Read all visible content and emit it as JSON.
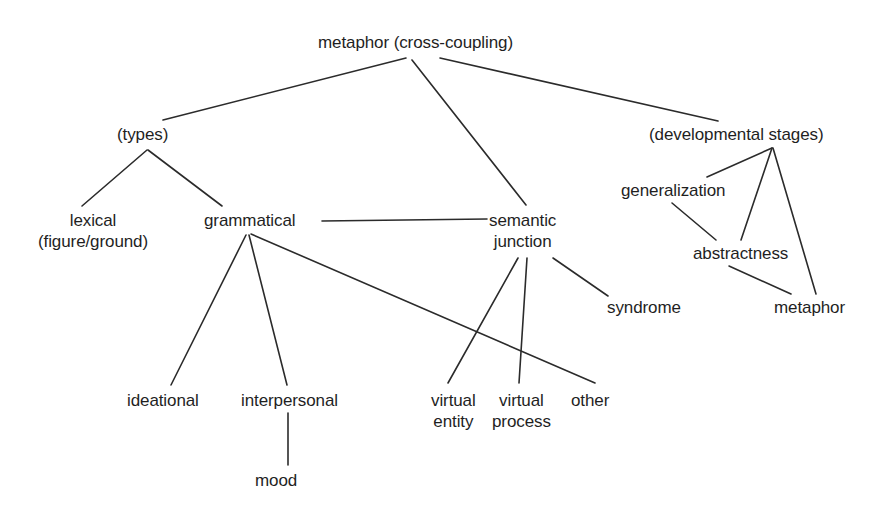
{
  "diagram": {
    "title": "metaphor (cross-coupling)",
    "type": "tree-diagram",
    "background_color": "#ffffff",
    "line_color": "#2b2b2b",
    "text_color": "#1f1f1f",
    "nodes": [
      {
        "id": "metaphor_root",
        "label": "metaphor (cross-coupling)",
        "label2": "",
        "x": 318,
        "y": 32,
        "w": 215
      },
      {
        "id": "types",
        "label": "(types)",
        "label2": "",
        "x": 117,
        "y": 124,
        "w": 64
      },
      {
        "id": "developmental_stages",
        "label": "(developmental stages)",
        "label2": "",
        "x": 649,
        "y": 124,
        "w": 180
      },
      {
        "id": "lexical",
        "label": "lexical",
        "label2": "(figure/ground)",
        "x": 38,
        "y": 210,
        "w": 128
      },
      {
        "id": "grammatical",
        "label": "grammatical",
        "label2": "",
        "x": 204,
        "y": 210,
        "w": 103
      },
      {
        "id": "semantic_junction",
        "label": "semantic",
        "label2": "junction",
        "x": 489,
        "y": 210,
        "w": 82
      },
      {
        "id": "generalization",
        "label": "generalization",
        "label2": "",
        "x": 621,
        "y": 180,
        "w": 110
      },
      {
        "id": "abstractness",
        "label": "abstractness",
        "label2": "",
        "x": 693,
        "y": 243,
        "w": 102
      },
      {
        "id": "syndrome",
        "label": "syndrome",
        "label2": "",
        "x": 607,
        "y": 297,
        "w": 86
      },
      {
        "id": "metaphor_leaf",
        "label": "metaphor",
        "label2": "",
        "x": 774,
        "y": 297,
        "w": 82
      },
      {
        "id": "ideational",
        "label": "ideational",
        "label2": "",
        "x": 127,
        "y": 390,
        "w": 75
      },
      {
        "id": "interpersonal",
        "label": "interpersonal",
        "label2": "",
        "x": 241,
        "y": 390,
        "w": 112
      },
      {
        "id": "virtual_entity",
        "label": "virtual",
        "label2": "entity",
        "x": 431,
        "y": 390,
        "w": 55
      },
      {
        "id": "virtual_process",
        "label": "virtual",
        "label2": "process",
        "x": 492,
        "y": 390,
        "w": 68
      },
      {
        "id": "other",
        "label": "other",
        "label2": "",
        "x": 571,
        "y": 390,
        "w": 48
      },
      {
        "id": "mood",
        "label": "mood",
        "label2": "",
        "x": 255,
        "y": 470,
        "w": 52
      }
    ],
    "edges": [
      {
        "from": "metaphor_root",
        "to": "types",
        "x1": 406,
        "y1": 58,
        "x2": 163,
        "y2": 120
      },
      {
        "from": "metaphor_root",
        "to": "semantic_junction",
        "x1": 412,
        "y1": 60,
        "x2": 526,
        "y2": 205
      },
      {
        "from": "metaphor_root",
        "to": "developmental_stages",
        "x1": 440,
        "y1": 58,
        "x2": 718,
        "y2": 121
      },
      {
        "from": "types",
        "to": "lexical",
        "x1": 147,
        "y1": 150,
        "x2": 82,
        "y2": 206
      },
      {
        "from": "types",
        "to": "grammatical",
        "x1": 148,
        "y1": 150,
        "x2": 222,
        "y2": 206
      },
      {
        "from": "grammatical",
        "to": "semantic_junction",
        "x1": 322,
        "y1": 221,
        "x2": 487,
        "y2": 219
      },
      {
        "from": "grammatical",
        "to": "ideational",
        "x1": 246,
        "y1": 235,
        "x2": 171,
        "y2": 385
      },
      {
        "from": "grammatical",
        "to": "interpersonal",
        "x1": 249,
        "y1": 235,
        "x2": 287,
        "y2": 385
      },
      {
        "from": "grammatical",
        "to": "other",
        "x1": 251,
        "y1": 234,
        "x2": 595,
        "y2": 383
      },
      {
        "from": "semantic_junction",
        "to": "virtual_entity",
        "x1": 518,
        "y1": 258,
        "x2": 448,
        "y2": 383
      },
      {
        "from": "semantic_junction",
        "to": "virtual_process",
        "x1": 527,
        "y1": 258,
        "x2": 519,
        "y2": 383
      },
      {
        "from": "semantic_junction",
        "to": "syndrome",
        "x1": 553,
        "y1": 258,
        "x2": 608,
        "y2": 296
      },
      {
        "from": "interpersonal",
        "to": "mood",
        "x1": 288,
        "y1": 413,
        "x2": 288,
        "y2": 465
      },
      {
        "from": "developmental_stages",
        "to": "generalization",
        "x1": 772,
        "y1": 148,
        "x2": 707,
        "y2": 177
      },
      {
        "from": "developmental_stages",
        "to": "abstractness",
        "x1": 772,
        "y1": 148,
        "x2": 741,
        "y2": 240
      },
      {
        "from": "developmental_stages",
        "to": "metaphor_leaf",
        "x1": 773,
        "y1": 148,
        "x2": 816,
        "y2": 294
      },
      {
        "from": "generalization",
        "to": "abstractness",
        "x1": 672,
        "y1": 203,
        "x2": 716,
        "y2": 240
      },
      {
        "from": "abstractness",
        "to": "metaphor_leaf",
        "x1": 729,
        "y1": 266,
        "x2": 791,
        "y2": 294
      }
    ]
  }
}
